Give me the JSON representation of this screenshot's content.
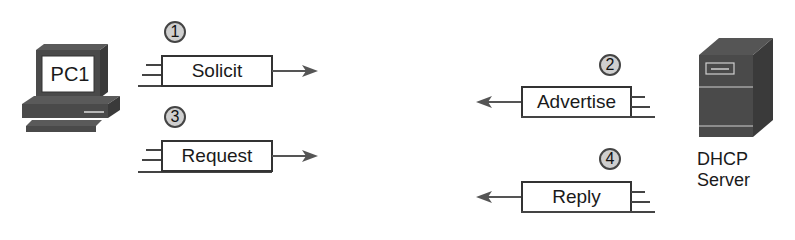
{
  "diagram": {
    "colors": {
      "device_fill": "#4a4a4a",
      "device_dark": "#333333",
      "step_fill": "#cfcfcf",
      "line": "#444444"
    },
    "client": {
      "label": "PC1",
      "icon": "pc-icon"
    },
    "server": {
      "label_line1": "DHCP",
      "label_line2": "Server",
      "icon": "server-icon"
    },
    "messages": [
      {
        "step": "1",
        "label": "Solicit",
        "direction": "client-to-server"
      },
      {
        "step": "2",
        "label": "Advertise",
        "direction": "server-to-client"
      },
      {
        "step": "3",
        "label": "Request",
        "direction": "client-to-server"
      },
      {
        "step": "4",
        "label": "Reply",
        "direction": "server-to-client"
      }
    ]
  }
}
